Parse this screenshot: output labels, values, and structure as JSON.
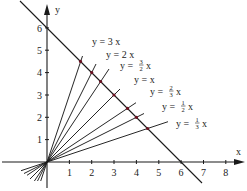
{
  "diagram": {
    "type": "coordinate-plot",
    "origin_px": [
      47,
      162
    ],
    "unit_px": 22.35,
    "axes": {
      "x_label": "x",
      "y_label": "y",
      "x_ticks": [
        "1",
        "2",
        "3",
        "4",
        "5",
        "6",
        "7",
        "8"
      ],
      "y_ticks": [
        "1",
        "2",
        "3",
        "4",
        "5",
        "6"
      ]
    },
    "constraint_line": {
      "equation": "x + y = 6",
      "x_intercept": 6,
      "y_intercept": 6
    },
    "rays": [
      {
        "slope": 3,
        "label_prefix": "y = ",
        "label_coef": "3",
        "label_suffix": " x",
        "intersection": [
          1.5,
          4.5
        ]
      },
      {
        "slope": 2,
        "label_prefix": "y = ",
        "label_coef": "2",
        "label_suffix": " x",
        "intersection": [
          2,
          4
        ]
      },
      {
        "slope": 1.5,
        "label_prefix": "y = ",
        "label_num": "3",
        "label_den": "2",
        "label_suffix": " x",
        "intersection": [
          2.4,
          3.6
        ]
      },
      {
        "slope": 1,
        "label_prefix": "y = ",
        "label_coef": "",
        "label_suffix": "x",
        "intersection": [
          3,
          3
        ]
      },
      {
        "slope": 0.6667,
        "label_prefix": "y = ",
        "label_num": "2",
        "label_den": "3",
        "label_suffix": " x",
        "intersection": [
          3.6,
          2.4
        ]
      },
      {
        "slope": 0.5,
        "label_prefix": "y = ",
        "label_num": "1",
        "label_den": "2",
        "label_suffix": " x",
        "intersection": [
          4,
          2
        ]
      },
      {
        "slope": 0.3333,
        "label_prefix": "y = ",
        "label_num": "1",
        "label_den": "3",
        "label_suffix": " x",
        "intersection": [
          4.5,
          1.5
        ]
      }
    ],
    "labels": {
      "r0": "y = 3 x",
      "r1": "y = 2 x",
      "r2_pre": "y =",
      "r2_num": "3",
      "r2_den": "2",
      "r2_x": "x",
      "r3": "y = x",
      "r4_pre": "y =",
      "r4_num": "2",
      "r4_den": "3",
      "r4_x": "x",
      "r5_pre": "y =",
      "r5_num": "1",
      "r5_den": "2",
      "r5_x": "x",
      "r6_pre": "y =",
      "r6_num": "1",
      "r6_den": "3",
      "r6_x": "x"
    },
    "colors": {
      "line": "#1a1a1a",
      "intersection_point": "#6b1020"
    }
  }
}
